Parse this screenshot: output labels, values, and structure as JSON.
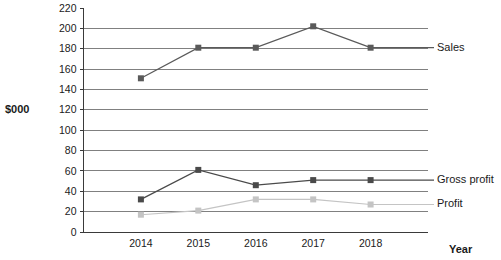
{
  "chart_data": {
    "type": "line",
    "title": "",
    "subtitle": "",
    "xlabel": "Year",
    "ylabel": "$000",
    "categories": [
      "2014",
      "2015",
      "2016",
      "2017",
      "2018"
    ],
    "x": [
      2014,
      2015,
      2016,
      2017,
      2018
    ],
    "series": [
      {
        "name": "Sales",
        "values": [
          151,
          181,
          181,
          202,
          181
        ],
        "color": "#5a5a5a",
        "marker": "square",
        "label_position": "right-of-last-point"
      },
      {
        "name": "Gross profit",
        "values": [
          32,
          61,
          46,
          51,
          51
        ],
        "color": "#4a4a4a",
        "marker": "square",
        "label_position": "right-of-last-point"
      },
      {
        "name": "Profit",
        "values": [
          17,
          21,
          32,
          32,
          27
        ],
        "color": "#c4c4c4",
        "marker": "square",
        "label_position": "right-of-last-point"
      }
    ],
    "ylim": [
      0,
      220
    ],
    "ytick_step": 20,
    "ytick_labels": [
      "0",
      "20",
      "40",
      "60",
      "80",
      "100",
      "120",
      "140",
      "160",
      "180",
      "200",
      "220"
    ],
    "grid": true,
    "grid_axis": "y",
    "grid_color": "#808080",
    "legend": "inline-right",
    "background": "#ffffff"
  },
  "axis_titles": {
    "y": "$000",
    "x": "Year"
  }
}
